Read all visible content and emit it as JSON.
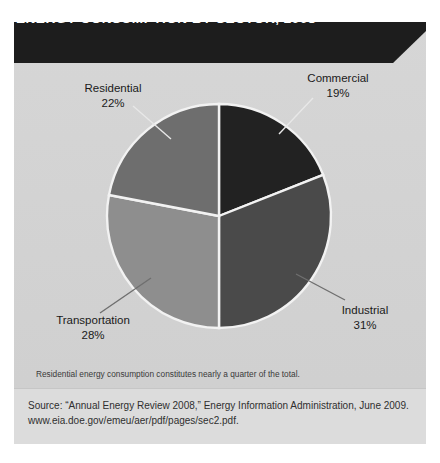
{
  "header": {
    "title": "ENERGY CONSUMPTION BY SECTOR, 2008",
    "bar_color": "#1d1d1d",
    "text_color": "#ffffff"
  },
  "panel": {
    "background_color": "#d4d4d4",
    "footer_band_color": "#dcdcdc"
  },
  "caption": {
    "text": "Residential energy consumption constitutes nearly a quarter of the total."
  },
  "source": {
    "line1": "Source: “Annual Energy Review 2008,” Energy Information Administration, June 2009.",
    "line2": "www.eia.doe.gov/emeu/aer/pdf/pages/sec2.pdf."
  },
  "labels": {
    "residential": {
      "name": "Residential",
      "percent": "22%"
    },
    "commercial": {
      "name": "Commercial",
      "percent": "19%"
    },
    "transportation": {
      "name": "Transportation",
      "percent": "28%"
    },
    "industrial": {
      "name": "Industrial",
      "percent": "31%"
    }
  },
  "chart_data": {
    "type": "pie",
    "title": "ENERGY CONSUMPTION BY SECTOR, 2008",
    "subtitle": "",
    "xlabel": "",
    "ylabel": "",
    "unit": "percent",
    "total": 100,
    "start_angle_deg": 0,
    "direction": "clockwise",
    "legend_position": "callout-labels",
    "grid": false,
    "categories": [
      "Commercial",
      "Industrial",
      "Transportation",
      "Residential"
    ],
    "values": [
      19,
      31,
      28,
      22
    ],
    "slices": [
      {
        "label": "Commercial",
        "value": 19,
        "display": "19%",
        "color": "#222222",
        "start_deg": 0,
        "end_deg": 68.4,
        "position": "top-right"
      },
      {
        "label": "Industrial",
        "value": 31,
        "display": "31%",
        "color": "#4a4a4a",
        "start_deg": 68.4,
        "end_deg": 180.0,
        "position": "bottom-right"
      },
      {
        "label": "Transportation",
        "value": 28,
        "display": "28%",
        "color": "#8e8e8e",
        "start_deg": 180.0,
        "end_deg": 280.8,
        "position": "bottom-left"
      },
      {
        "label": "Residential",
        "value": 22,
        "display": "22%",
        "color": "#6e6e6e",
        "start_deg": 280.8,
        "end_deg": 360.0,
        "position": "top-left"
      }
    ],
    "slice_border_color": "#f2f2f2",
    "annotations": [
      "Residential energy consumption constitutes nearly a quarter of the total."
    ]
  }
}
